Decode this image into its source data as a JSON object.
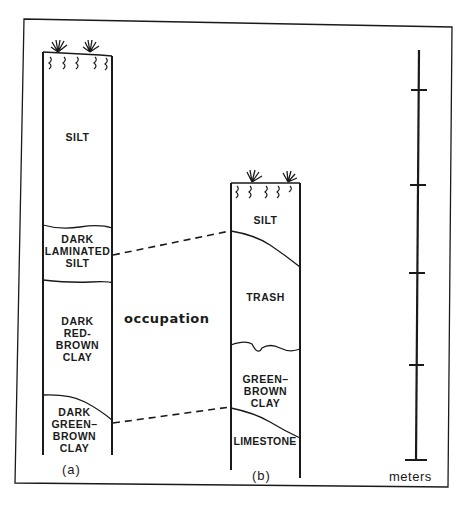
{
  "figure": {
    "column_a": {
      "caption": "(a)",
      "layers": [
        {
          "label": "SILT"
        },
        {
          "label": "DARK\nLAMINATED\nSILT"
        },
        {
          "label": "DARK\nRED-BROWN\nCLAY"
        },
        {
          "label": "DARK\nGREEN–\nBROWN\nCLAY"
        }
      ]
    },
    "column_b": {
      "caption": "(b)",
      "layers": [
        {
          "label": "SILT"
        },
        {
          "label": "TRASH"
        },
        {
          "label": "GREEN–\nBROWN\nCLAY"
        },
        {
          "label": "LIMESTONE"
        }
      ]
    },
    "correlation_label": "occupation",
    "scale": {
      "unit_label": "meters",
      "ticks": 5
    },
    "colors": {
      "ink": "#1a1a1a",
      "paper": "#ffffff"
    }
  }
}
